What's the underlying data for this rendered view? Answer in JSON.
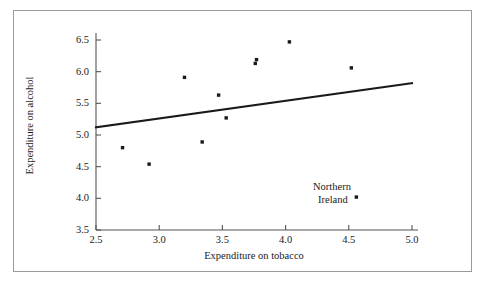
{
  "chart_data": {
    "type": "scatter",
    "title": "",
    "xlabel": "Expenditure on tobacco",
    "ylabel": "Expenditure on alcohol",
    "xlim": [
      2.5,
      5.0
    ],
    "ylim": [
      3.5,
      6.5
    ],
    "xticks": [
      "2.5",
      "3.0",
      "3.5",
      "4.0",
      "4.5",
      "5.0"
    ],
    "xtick_values": [
      2.5,
      3.0,
      3.5,
      4.0,
      4.5,
      5.0
    ],
    "yticks": [
      "3.5",
      "4.0",
      "4.5",
      "5.0",
      "5.5",
      "6.0",
      "6.5"
    ],
    "ytick_values": [
      3.5,
      4.0,
      4.5,
      5.0,
      5.5,
      6.0,
      6.5
    ],
    "grid": false,
    "legend": false,
    "marker": "filled-square",
    "marker_color": "#1a1a1a",
    "points": [
      {
        "x": 2.71,
        "y": 4.8
      },
      {
        "x": 2.92,
        "y": 4.54
      },
      {
        "x": 3.2,
        "y": 5.91
      },
      {
        "x": 3.34,
        "y": 4.89
      },
      {
        "x": 3.47,
        "y": 5.63
      },
      {
        "x": 3.53,
        "y": 5.27
      },
      {
        "x": 3.76,
        "y": 6.13
      },
      {
        "x": 3.77,
        "y": 6.19
      },
      {
        "x": 4.03,
        "y": 6.47
      },
      {
        "x": 4.52,
        "y": 6.06
      },
      {
        "x": 4.56,
        "y": 4.02,
        "label": "Northern Ireland"
      }
    ],
    "fit_line": {
      "type": "linear-regression",
      "color": "#1a1a1a",
      "x_start": 2.5,
      "y_start": 5.12,
      "x_end": 5.0,
      "y_end": 5.82
    },
    "annotations": [
      {
        "name": "northern-ireland-label",
        "line1": "Northern",
        "line2": "Ireland"
      }
    ]
  },
  "axes": {
    "y_axis_title": "Expenditure on alcohol",
    "x_axis_title": "Expenditure on tobacco"
  },
  "annotation": {
    "northern": "Northern",
    "ireland": "Ireland"
  },
  "colors": {
    "ink": "#1a1a1a",
    "frame": "#9a9a9a",
    "background": "#ffffff"
  }
}
